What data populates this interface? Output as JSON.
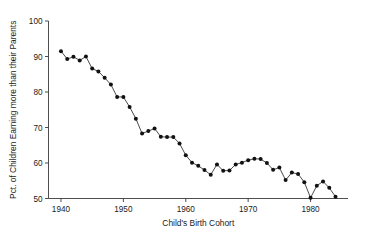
{
  "chart_data": {
    "type": "line",
    "title": "",
    "subtitle": "",
    "xlabel": "Child's Birth Cohort",
    "ylabel": "Pct. of Children Earning more than their Parents",
    "xlim": [
      1938,
      1986
    ],
    "ylim": [
      50,
      100
    ],
    "xticks": [
      1940,
      1950,
      1960,
      1970,
      1980
    ],
    "yticks": [
      50,
      60,
      70,
      80,
      90,
      100
    ],
    "xtick_labels": [
      "1940",
      "1950",
      "1960",
      "1970",
      "1980"
    ],
    "ytick_labels": [
      "50",
      "60",
      "70",
      "80",
      "90",
      "100"
    ],
    "grid": false,
    "legend": false,
    "legend_position": "none",
    "marker": "filled-circle",
    "line_color": "#2b2b2b",
    "marker_color": "#111111",
    "background_color": "#ffffff",
    "x": [
      1940,
      1941,
      1942,
      1943,
      1944,
      1945,
      1946,
      1947,
      1948,
      1949,
      1950,
      1951,
      1952,
      1953,
      1954,
      1955,
      1956,
      1957,
      1958,
      1959,
      1960,
      1961,
      1962,
      1963,
      1964,
      1965,
      1966,
      1967,
      1968,
      1969,
      1970,
      1971,
      1972,
      1973,
      1974,
      1975,
      1976,
      1977,
      1978,
      1979,
      1980,
      1981,
      1982,
      1983,
      1984
    ],
    "values": [
      91.5,
      89.3,
      89.9,
      88.9,
      90.0,
      86.6,
      85.8,
      84.0,
      82.1,
      78.6,
      78.6,
      75.8,
      72.5,
      68.3,
      69.0,
      69.7,
      67.4,
      67.3,
      67.3,
      65.5,
      62.2,
      60.1,
      59.2,
      58.0,
      56.7,
      59.6,
      57.8,
      57.9,
      59.6,
      60.1,
      60.8,
      61.2,
      61.1,
      60.0,
      58.1,
      58.7,
      55.2,
      57.3,
      56.9,
      54.6,
      50.2,
      53.6,
      54.8,
      53.0,
      50.5
    ],
    "series": [
      {
        "name": "Pct. of Children Earning more than their Parents",
        "values": [
          91.5,
          89.3,
          89.9,
          88.9,
          90.0,
          86.6,
          85.8,
          84.0,
          82.1,
          78.6,
          78.6,
          75.8,
          72.5,
          68.3,
          69.0,
          69.7,
          67.4,
          67.3,
          67.3,
          65.5,
          62.2,
          60.1,
          59.2,
          58.0,
          56.7,
          59.6,
          57.8,
          57.9,
          59.6,
          60.1,
          60.8,
          61.2,
          61.1,
          60.0,
          58.1,
          58.7,
          55.2,
          57.3,
          56.9,
          54.6,
          50.2,
          53.6,
          54.8,
          53.0,
          50.5
        ]
      }
    ]
  }
}
